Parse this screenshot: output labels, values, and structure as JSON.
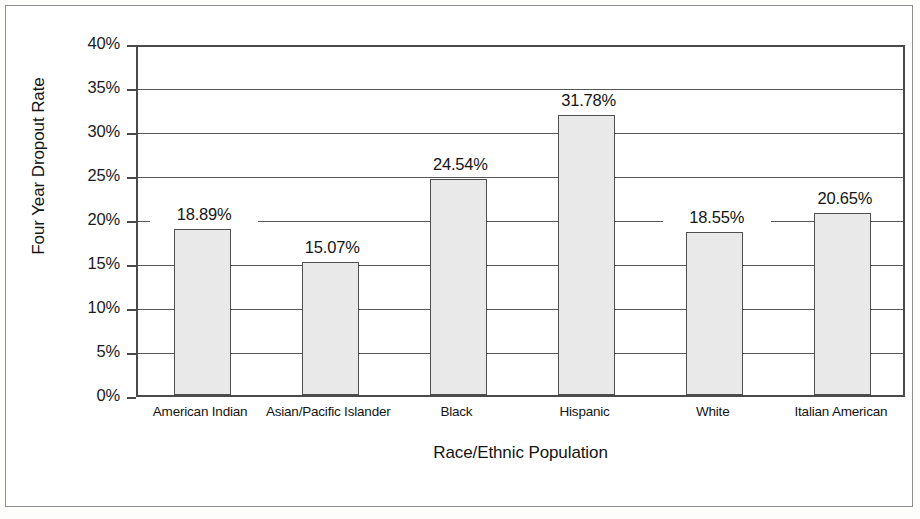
{
  "chart_data": {
    "type": "bar",
    "title": "",
    "xlabel": "Race/Ethnic Population",
    "ylabel": "Four Year Dropout Rate",
    "categories": [
      "American Indian",
      "Asian/Pacific Islander",
      "Black",
      "Hispanic",
      "White",
      "Italian American"
    ],
    "values": [
      18.89,
      15.07,
      24.54,
      31.78,
      18.55,
      20.65
    ],
    "value_labels": [
      "18.89%",
      "15.07%",
      "24.54%",
      "31.78%",
      "18.55%",
      "20.65%"
    ],
    "ylim": [
      0,
      40
    ],
    "ytick_values": [
      0,
      5,
      10,
      15,
      20,
      25,
      30,
      35,
      40
    ],
    "ytick_labels": [
      "0%",
      "5%",
      "10%",
      "15%",
      "20%",
      "25%",
      "30%",
      "35%",
      "40%"
    ],
    "grid": true,
    "legend": null,
    "legend_position": "none",
    "bar_fill_color": "#e9e9e9",
    "bar_border_color": "#4f4f4f",
    "gridline_color": "#575757",
    "axis_color": "#4a4a4a",
    "text_color": "#141414",
    "background_color": "#ffffff"
  },
  "axes": {
    "y_title": "Four Year Dropout Rate",
    "x_title": "Race/Ethnic Population"
  },
  "ticks": {
    "y": [
      {
        "label": "40%",
        "value": 40
      },
      {
        "label": "35%",
        "value": 35
      },
      {
        "label": "30%",
        "value": 30
      },
      {
        "label": "25%",
        "value": 25
      },
      {
        "label": "20%",
        "value": 20
      },
      {
        "label": "15%",
        "value": 15
      },
      {
        "label": "10%",
        "value": 10
      },
      {
        "label": "5%",
        "value": 5
      },
      {
        "label": "0%",
        "value": 0
      }
    ]
  },
  "bars": [
    {
      "category": "American Indian",
      "value": 18.89,
      "label": "18.89%"
    },
    {
      "category": "Asian/Pacific Islander",
      "value": 15.07,
      "label": "15.07%"
    },
    {
      "category": "Black",
      "value": 24.54,
      "label": "24.54%"
    },
    {
      "category": "Hispanic",
      "value": 31.78,
      "label": "31.78%"
    },
    {
      "category": "White",
      "value": 18.55,
      "label": "18.55%"
    },
    {
      "category": "Italian American",
      "value": 20.65,
      "label": "20.65%"
    }
  ]
}
